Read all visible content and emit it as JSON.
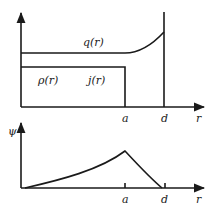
{
  "top_panel": {
    "curve_label_q": "q(r)",
    "label_rho": "ρ(r)",
    "label_j": "j(r)",
    "x_ticks": [
      "a",
      "d"
    ],
    "x_axis_label": "r"
  },
  "bottom_panel": {
    "y_axis_label": "ψ",
    "x_ticks": [
      "a",
      "d"
    ],
    "x_axis_label": "r"
  },
  "colors": {
    "ink": "#1a1a1a",
    "background": "#ffffff"
  }
}
